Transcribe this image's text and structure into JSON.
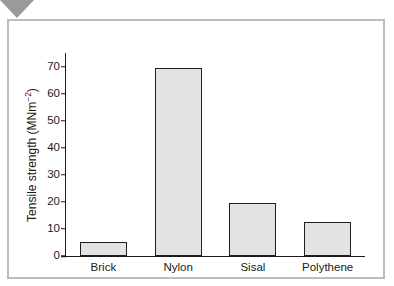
{
  "figure": {
    "marker_icon": "triangle-down-icon"
  },
  "chart_data": {
    "type": "bar",
    "title": "",
    "xlabel": "",
    "ylabel": "Tensile strength (MNm",
    "ylabel_exponent": "−2",
    "ylabel_close": ")",
    "categories": [
      "Brick",
      "Nylon",
      "Sisal",
      "Polythene"
    ],
    "values": [
      5,
      69.5,
      19.5,
      12.5
    ],
    "ylim": [
      0,
      75
    ],
    "yticks": [
      0,
      10,
      20,
      30,
      40,
      50,
      60,
      70
    ],
    "ytick_labels": [
      "0",
      "10",
      "20",
      "30",
      "40",
      "50",
      "60",
      "70"
    ],
    "grid": false,
    "legend": null,
    "bar_fill": "#e3e3e3",
    "bar_stroke": "#1f1f1f",
    "axis_color": "#1a1a1a",
    "frame_color": "#bdbdbd",
    "marker_color": "#9a9a9a"
  }
}
